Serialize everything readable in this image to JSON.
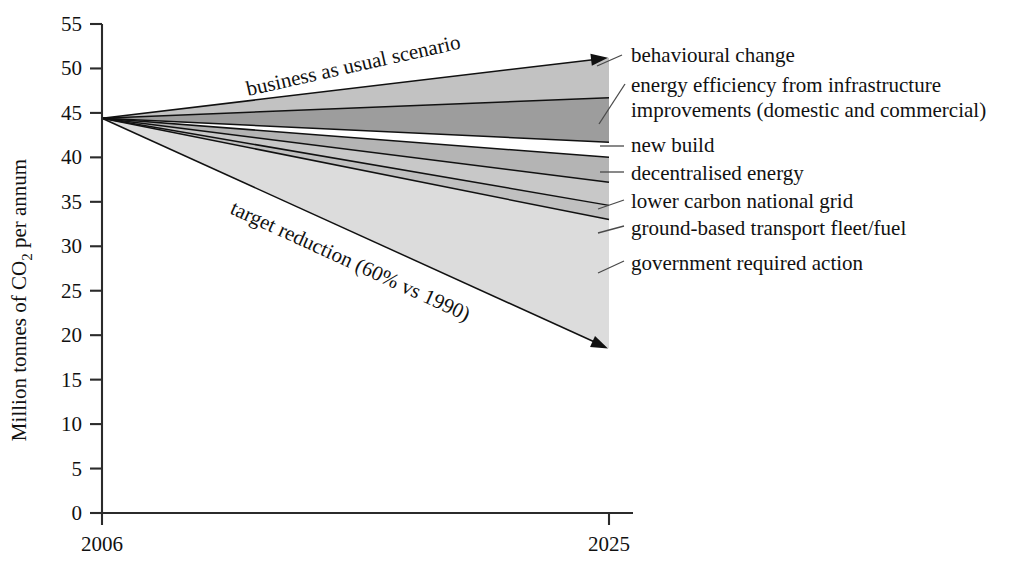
{
  "chart_data": {
    "type": "area",
    "title": "",
    "xlabel": "",
    "ylabel": "Million tonnes of CO2 per annum",
    "ylabel_parts": {
      "pre": "Million tonnes of CO",
      "sub": "2",
      "post": " per annum"
    },
    "x": [
      2006,
      2025
    ],
    "x_tick_labels": [
      "2006",
      "2025"
    ],
    "ylim": [
      0,
      55
    ],
    "ytick_values": [
      0,
      5,
      10,
      15,
      20,
      25,
      30,
      35,
      40,
      45,
      50,
      55
    ],
    "ytick_labels": [
      "0",
      "5",
      "10",
      "15",
      "20",
      "25",
      "30",
      "35",
      "40",
      "45",
      "50",
      "55"
    ],
    "grid": false,
    "legend_position": "right-callouts",
    "start_value_2006": 44.4,
    "annotations": [
      {
        "name": "business-as-usual",
        "text": "business as usual scenario",
        "rotation": -12.5
      },
      {
        "name": "target-reduction",
        "text": "target reduction (60% vs 1990)",
        "rotation": 24.5
      }
    ],
    "boundaries": [
      {
        "name": "business-as-usual-line",
        "label": "business as usual scenario",
        "y2006": 44.4,
        "y2025": 51.2,
        "arrow": true
      },
      {
        "name": "behavioural-change-line",
        "label": "behavioural change",
        "y2006": 44.4,
        "y2025": 46.7,
        "arrow": false
      },
      {
        "name": "energy-efficiency-line",
        "label": "energy efficiency from infrastructure improvements (domestic and commercial)",
        "y2006": 44.4,
        "y2025": 41.7,
        "arrow": false
      },
      {
        "name": "new-build-line",
        "label": "new build",
        "y2006": 44.4,
        "y2025": 40.0,
        "arrow": false
      },
      {
        "name": "decentralised-energy-line",
        "label": "decentralised energy",
        "y2006": 44.4,
        "y2025": 37.2,
        "arrow": false
      },
      {
        "name": "lower-carbon-grid-line",
        "label": "lower carbon national grid",
        "y2006": 44.4,
        "y2025": 34.6,
        "arrow": false
      },
      {
        "name": "ground-transport-line",
        "label": "ground-based transport fleet/fuel",
        "y2006": 44.4,
        "y2025": 33.0,
        "arrow": false
      },
      {
        "name": "target-reduction-line",
        "label": "government required action",
        "y2006": 44.4,
        "y2025": 18.5,
        "arrow": true
      }
    ],
    "bands": [
      {
        "name": "behavioural-change-band",
        "upper_y2025": 51.2,
        "lower_y2025": 46.7,
        "fill": "#c2c2c2"
      },
      {
        "name": "energy-efficiency-band",
        "upper_y2025": 46.7,
        "lower_y2025": 41.7,
        "fill": "#9d9d9d"
      },
      {
        "name": "new-build-band",
        "upper_y2025": 41.7,
        "lower_y2025": 40.0,
        "fill": "#ffffff"
      },
      {
        "name": "decentralised-energy-band",
        "upper_y2025": 40.0,
        "lower_y2025": 37.2,
        "fill": "#b4b4b4"
      },
      {
        "name": "lower-carbon-grid-band",
        "upper_y2025": 37.2,
        "lower_y2025": 34.6,
        "fill": "#c8c8c8"
      },
      {
        "name": "ground-transport-band",
        "upper_y2025": 34.6,
        "lower_y2025": 33.0,
        "fill": "#c0c0c0"
      },
      {
        "name": "government-action-band",
        "upper_y2025": 33.0,
        "lower_y2025": 18.5,
        "fill": "#dcdcdc"
      }
    ]
  },
  "axis": {
    "y_title_pre": "Million tonnes of CO",
    "y_title_sub": "2",
    "y_title_post": " per annum",
    "x_tick_start": "2006",
    "x_tick_end": "2025",
    "y_ticks": [
      "55",
      "50",
      "45",
      "40",
      "35",
      "30",
      "25",
      "20",
      "15",
      "10",
      "5",
      "0"
    ]
  },
  "inline_labels": {
    "business_as_usual": "business as usual scenario",
    "target_reduction": "target reduction (60% vs 1990)"
  },
  "callouts": [
    {
      "id": "behavioural-change",
      "text": "behavioural change",
      "text2": ""
    },
    {
      "id": "energy-efficiency",
      "text": "energy efficiency from infrastructure",
      "text2": "improvements (domestic and commercial)"
    },
    {
      "id": "new-build",
      "text": "new build",
      "text2": ""
    },
    {
      "id": "decentralised-energy",
      "text": "decentralised energy",
      "text2": ""
    },
    {
      "id": "lower-carbon-grid",
      "text": "lower carbon national grid",
      "text2": ""
    },
    {
      "id": "ground-transport",
      "text": "ground-based transport fleet/fuel",
      "text2": ""
    },
    {
      "id": "government-action",
      "text": "government required action",
      "text2": ""
    }
  ],
  "colors": {
    "axis": "#2b2b2b",
    "text": "#111111",
    "band_light": "#dcdcdc",
    "band_mid": "#c2c2c2",
    "band_dark": "#9d9d9d"
  }
}
